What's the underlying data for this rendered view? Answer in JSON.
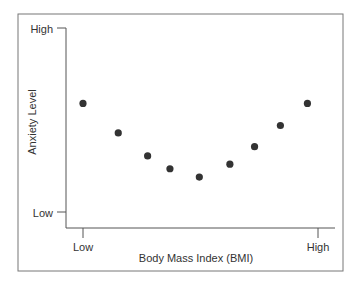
{
  "chart_data": {
    "type": "scatter",
    "title": "",
    "xlabel": "Body Mass Index (BMI)",
    "ylabel": "Anxiety Level",
    "x_ticks": [
      "Low",
      "High"
    ],
    "y_ticks": [
      "Low",
      "High"
    ],
    "xlim": [
      0,
      10
    ],
    "ylim": [
      0,
      10
    ],
    "grid": false,
    "legend": null,
    "x": [
      0,
      1.5,
      2.75,
      3.7,
      4.95,
      6.25,
      7.3,
      8.4,
      9.55
    ],
    "y": [
      5.9,
      4.3,
      3.05,
      2.35,
      1.9,
      2.6,
      3.55,
      4.7,
      5.9
    ],
    "point_color": "#333333"
  }
}
